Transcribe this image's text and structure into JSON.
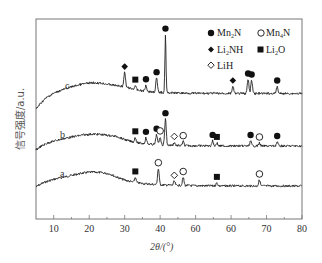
{
  "chart_data": {
    "type": "line",
    "title": "",
    "xlabel": "2θ/(°)",
    "ylabel": "信号强度/a.u.",
    "xlim": [
      5,
      80
    ],
    "x_ticks": [
      10,
      20,
      30,
      40,
      50,
      60,
      70,
      80
    ],
    "x_tick_labels": [
      "10",
      "20",
      "30",
      "40",
      "60",
      "60",
      "70",
      "80"
    ],
    "y_ticks": [],
    "grid": false,
    "legend_position": "top-right inside",
    "legend": [
      {
        "name": "Mn2N",
        "marker": "filled-circle"
      },
      {
        "name": "Mn4N",
        "marker": "open-circle"
      },
      {
        "name": "Li2NH",
        "marker": "filled-diamond"
      },
      {
        "name": "Li2O",
        "marker": "filled-square"
      },
      {
        "name": "LiH",
        "marker": "open-diamond"
      }
    ],
    "series": [
      {
        "name": "a",
        "baseline_offset": 0,
        "peaks": [
          {
            "x": 33.0,
            "h": 5,
            "phase": "Li2O"
          },
          {
            "x": 39.5,
            "h": 16,
            "phase": "Mn4N"
          },
          {
            "x": 44.0,
            "h": 4,
            "phase": "LiH"
          },
          {
            "x": 46.5,
            "h": 8,
            "phase": "Mn4N"
          },
          {
            "x": 56.0,
            "h": 3,
            "phase": "Li2O"
          },
          {
            "x": 68.0,
            "h": 6,
            "phase": "Mn4N"
          }
        ]
      },
      {
        "name": "b",
        "baseline_offset": 1,
        "peaks": [
          {
            "x": 33.0,
            "h": 5,
            "phase": "Li2O"
          },
          {
            "x": 36.0,
            "h": 6,
            "phase": "Mn2N"
          },
          {
            "x": 39.0,
            "h": 10,
            "phase": "Mn2N"
          },
          {
            "x": 40.0,
            "h": 8,
            "phase": "Mn4N"
          },
          {
            "x": 41.5,
            "h": 26,
            "phase": "Mn2N"
          },
          {
            "x": 44.0,
            "h": 3,
            "phase": "LiH"
          },
          {
            "x": 46.5,
            "h": 4,
            "phase": "Mn4N"
          },
          {
            "x": 54.8,
            "h": 5,
            "phase": "Mn2N"
          },
          {
            "x": 56.0,
            "h": 3,
            "phase": "Li2O"
          },
          {
            "x": 65.5,
            "h": 5,
            "phase": "Mn2N"
          },
          {
            "x": 68.0,
            "h": 3,
            "phase": "Mn4N"
          },
          {
            "x": 73.0,
            "h": 4,
            "phase": "Mn2N"
          }
        ]
      },
      {
        "name": "c",
        "baseline_offset": 2,
        "peaks": [
          {
            "x": 30.0,
            "h": 14,
            "phase": "Li2NH"
          },
          {
            "x": 33.0,
            "h": 4,
            "phase": "Li2O"
          },
          {
            "x": 36.0,
            "h": 6,
            "phase": "Mn2N"
          },
          {
            "x": 39.0,
            "h": 14,
            "phase": "Mn2N"
          },
          {
            "x": 41.5,
            "h": 58,
            "phase": "Mn2N"
          },
          {
            "x": 60.5,
            "h": 7,
            "phase": "Li2NH"
          },
          {
            "x": 64.8,
            "h": 14,
            "phase": "Mn2N"
          },
          {
            "x": 65.8,
            "h": 13,
            "phase": "Mn2N"
          },
          {
            "x": 73.0,
            "h": 7,
            "phase": "Mn2N"
          }
        ]
      }
    ]
  },
  "legend_labels": {
    "mn2n": "Mn2N",
    "mn4n": "Mn4N",
    "li2nh": "Li2NH",
    "li2o": "Li2O",
    "lih": "LiH"
  },
  "curve_labels": {
    "a": "a",
    "b": "b",
    "c": "c"
  },
  "axes": {
    "xlabel": "2θ/(°)",
    "ylabel": "信号强度/a.u."
  }
}
